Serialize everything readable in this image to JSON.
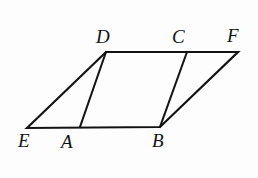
{
  "figure": {
    "kind": "geometry-diagram",
    "canvas": {
      "width": 258,
      "height": 178
    },
    "background_color": "#fdfdfd",
    "stroke_color": "#131313",
    "stroke_width": 2.2,
    "points": {
      "E": {
        "x": 27,
        "y": 128,
        "label": "E",
        "label_x": 18,
        "label_y": 131
      },
      "A": {
        "x": 80,
        "y": 127,
        "label": "A",
        "label_x": 61,
        "label_y": 132
      },
      "B": {
        "x": 160,
        "y": 127,
        "label": "B",
        "label_x": 152,
        "label_y": 131
      },
      "D": {
        "x": 106,
        "y": 52,
        "label": "D",
        "label_x": 96,
        "label_y": 27
      },
      "C": {
        "x": 187,
        "y": 52,
        "label": "C",
        "label_x": 172,
        "label_y": 27
      },
      "F": {
        "x": 238,
        "y": 52,
        "label": "F",
        "label_x": 227,
        "label_y": 26
      }
    },
    "outline": {
      "name": "parallelogram-EDFB",
      "vertices": [
        "E",
        "D",
        "F",
        "B"
      ],
      "path": "M 27 128 L 106 52 L 238 52 L 160 127 Z"
    },
    "segments": [
      {
        "name": "segment-DA",
        "from": "D",
        "to": "A",
        "path": "M 106 52 L 80 127"
      },
      {
        "name": "segment-CB",
        "from": "C",
        "to": "B",
        "path": "M 187 52 L 160 127"
      }
    ],
    "labels": [
      {
        "id": "D",
        "text": "D"
      },
      {
        "id": "C",
        "text": "C"
      },
      {
        "id": "F",
        "text": "F"
      },
      {
        "id": "E",
        "text": "E"
      },
      {
        "id": "A",
        "text": "A"
      },
      {
        "id": "B",
        "text": "B"
      }
    ]
  }
}
